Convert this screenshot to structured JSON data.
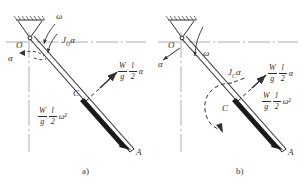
{
  "figure": {
    "kind": "engineering-mechanics-free-body-diagram",
    "panels": [
      {
        "id": "a",
        "caption": "a)",
        "points": {
          "pivot": "O",
          "center": "C",
          "end": "A"
        },
        "angular_velocity": "ω",
        "angular_acceleration": "α",
        "moment_label": {
          "symbol": "J",
          "subscript": "O",
          "factor": "α"
        },
        "forces": [
          {
            "name": "tangential-inertia-force",
            "num": "W",
            "den": "g",
            "num2": "l",
            "den2": "2",
            "tail": "α"
          },
          {
            "name": "normal-inertia-force",
            "num": "W",
            "den": "g",
            "num2": "l",
            "den2": "2",
            "tail": "ω²"
          }
        ]
      },
      {
        "id": "b",
        "caption": "b)",
        "points": {
          "pivot": "O",
          "center": "C",
          "end": "A"
        },
        "angular_velocity": "ω",
        "angular_acceleration": "α",
        "moment_label": {
          "symbol": "J",
          "subscript": "C",
          "factor": "α"
        },
        "forces": [
          {
            "name": "tangential-inertia-force",
            "num": "W",
            "den": "g",
            "num2": "l",
            "den2": "2",
            "tail": "α"
          },
          {
            "name": "normal-inertia-force",
            "num": "W",
            "den": "g",
            "num2": "l",
            "den2": "2",
            "tail": "ω²"
          }
        ]
      }
    ],
    "colors": {
      "ink": "#303030",
      "rod_fill": "#1a1a1a",
      "centerline": "#8a8a8a",
      "background": "#ffffff"
    }
  }
}
